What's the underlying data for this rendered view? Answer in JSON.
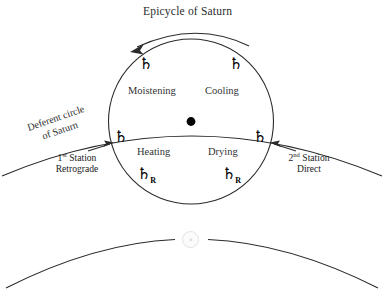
{
  "figure": {
    "title": "Epicycle of Saturn",
    "deferent_label_line1": "Deferent circle",
    "deferent_label_line2": "of Saturn"
  },
  "quadrants": [
    {
      "name": "moistening",
      "label": "Moistening"
    },
    {
      "name": "cooling",
      "label": "Cooling"
    },
    {
      "name": "heating",
      "label": "Heating"
    },
    {
      "name": "drying",
      "label": "Drying"
    }
  ],
  "stations": {
    "first": {
      "number": "1",
      "ordinal": "st",
      "word": "Station",
      "state": "Retrograde"
    },
    "second": {
      "number": "2",
      "ordinal": "nd",
      "word": "Station",
      "state": "Direct"
    }
  },
  "planet_markers": [
    {
      "name": "saturn-upper-left",
      "glyph": "♄",
      "retrograde": ""
    },
    {
      "name": "saturn-upper-right",
      "glyph": "♄",
      "retrograde": ""
    },
    {
      "name": "saturn-left-station",
      "glyph": "♄",
      "retrograde": ""
    },
    {
      "name": "saturn-right-station",
      "glyph": "♄",
      "retrograde": ""
    },
    {
      "name": "saturn-lower-left-retrograde",
      "glyph": "♄",
      "retrograde": "R"
    },
    {
      "name": "saturn-lower-right-retrograde",
      "glyph": "♄",
      "retrograde": "R"
    }
  ],
  "icons": {
    "earth": "earth-icon",
    "center_dot": "epicycle-center-dot"
  },
  "colors": {
    "stroke": "#2b2b2b",
    "text": "#2b2b2b",
    "glyph": "#000000",
    "earth": "#e2e2e2",
    "background": "#ffffff"
  }
}
